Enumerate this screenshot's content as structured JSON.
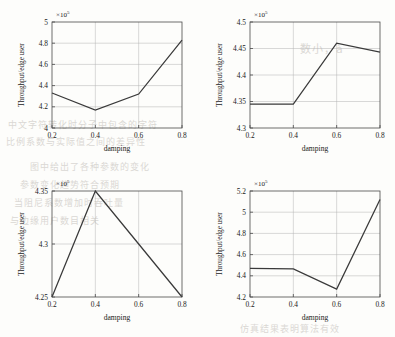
{
  "figure": {
    "background": "#fdfdfb",
    "line_color": "#3a3a3a",
    "grid_color": "#b3b3b3",
    "axis_color": "#4a4a4a"
  },
  "bleed_text": [
    {
      "text": "数小，à",
      "x": 300,
      "y": 40,
      "size": 11
    },
    {
      "text": "中文字符转化时分子中包含的字符",
      "x": 8,
      "y": 118,
      "size": 9
    },
    {
      "text": "比例系数与实际值之间的差异性",
      "x": 6,
      "y": 135,
      "size": 9
    },
    {
      "text": "图中给出了各种参数的变化",
      "x": 30,
      "y": 160,
      "size": 9
    },
    {
      "text": "参数变化趋势符合预期",
      "x": 20,
      "y": 178,
      "size": 9
    },
    {
      "text": "当阻尼系数增加时吞吐量",
      "x": 14,
      "y": 196,
      "size": 9
    },
    {
      "text": "与边缘用户数目相关",
      "x": 10,
      "y": 214,
      "size": 9
    },
    {
      "text": "仿真结果表明算法有效",
      "x": 240,
      "y": 322,
      "size": 9
    }
  ],
  "common": {
    "xlabel": "damping",
    "ylabel": "Throughput/edge user",
    "multiplier_prefix": "×10",
    "multiplier_exponent": "5",
    "x_ticks": [
      "0.2",
      "0.4",
      "0.6",
      "0.8"
    ],
    "x_values": [
      0.2,
      0.4,
      0.6,
      0.8
    ]
  },
  "chart_data": [
    {
      "id": "top-left",
      "type": "line",
      "title": "",
      "xlabel": "damping",
      "ylabel": "Throughput/edge user",
      "multiplier": "×10⁵",
      "x": [
        0.2,
        0.4,
        0.6,
        0.8
      ],
      "values": [
        4.33,
        4.17,
        4.32,
        4.83
      ],
      "unit_scale": 100000,
      "xlim": [
        0.2,
        0.8
      ],
      "ylim": [
        4.0,
        5.0
      ],
      "y_ticks": [
        "4",
        "4.2",
        "4.4",
        "4.6",
        "4.8",
        "5"
      ],
      "y_tick_values": [
        4.0,
        4.2,
        4.4,
        4.6,
        4.8,
        5.0
      ],
      "x_ticks": [
        "0.2",
        "0.4",
        "0.6",
        "0.8"
      ],
      "grid": true,
      "legend": "none"
    },
    {
      "id": "top-right",
      "type": "line",
      "title": "",
      "xlabel": "damping",
      "ylabel": "Throughput/edge user",
      "multiplier": "×10⁵",
      "x": [
        0.2,
        0.4,
        0.6,
        0.8
      ],
      "values": [
        4.345,
        4.345,
        4.46,
        4.443
      ],
      "unit_scale": 100000,
      "xlim": [
        0.2,
        0.8
      ],
      "ylim": [
        4.3,
        4.5
      ],
      "y_ticks": [
        "4.3",
        "4.35",
        "4.4",
        "4.45",
        "4.5"
      ],
      "y_tick_values": [
        4.3,
        4.35,
        4.4,
        4.45,
        4.5
      ],
      "x_ticks": [
        "0.2",
        "0.4",
        "0.6",
        "0.8"
      ],
      "grid": true,
      "legend": "none"
    },
    {
      "id": "bottom-left",
      "type": "line",
      "title": "",
      "xlabel": "damping",
      "ylabel": "Throughput/edge user",
      "multiplier": "×10⁵",
      "x": [
        0.2,
        0.4,
        0.6,
        0.8
      ],
      "values": [
        4.25,
        4.35,
        4.3,
        4.25
      ],
      "unit_scale": 100000,
      "xlim": [
        0.2,
        0.8
      ],
      "ylim": [
        4.25,
        4.35
      ],
      "y_ticks": [
        "4.25",
        "4.3",
        "4.35"
      ],
      "y_tick_values": [
        4.25,
        4.3,
        4.35
      ],
      "x_ticks": [
        "0.2",
        "0.4",
        "0.6",
        "0.8"
      ],
      "grid": true,
      "legend": "none"
    },
    {
      "id": "bottom-right",
      "type": "line",
      "title": "",
      "xlabel": "damping",
      "ylabel": "Throughput/edge user",
      "multiplier": "×10⁵",
      "x": [
        0.2,
        0.4,
        0.6,
        0.8
      ],
      "values": [
        4.47,
        4.465,
        4.275,
        5.12
      ],
      "unit_scale": 100000,
      "xlim": [
        0.2,
        0.8
      ],
      "ylim": [
        4.2,
        5.2
      ],
      "y_ticks": [
        "4.2",
        "4.4",
        "4.6",
        "4.8",
        "5",
        "5.2"
      ],
      "y_tick_values": [
        4.2,
        4.4,
        4.6,
        4.8,
        5.0,
        5.2
      ],
      "x_ticks": [
        "0.2",
        "0.4",
        "0.6",
        "0.8"
      ],
      "grid": true,
      "legend": "none"
    }
  ]
}
